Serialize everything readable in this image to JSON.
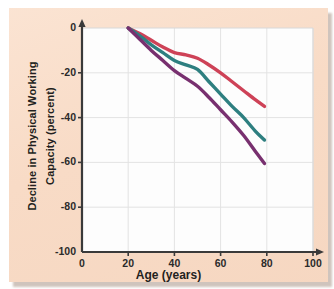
{
  "figure": {
    "background_color": "#f9ddc9",
    "plot_background_color": "#fdfdfd",
    "grid_color": "#e3e3e3",
    "axis_color": "#3a3a3a"
  },
  "chart_data": {
    "type": "line",
    "title": "",
    "subtitle": "",
    "xlabel": "Age (years)",
    "ylabel_line1": "Decline in Physical Working",
    "ylabel_line2": "Capacity (percent)",
    "xlim": [
      0,
      100
    ],
    "ylim": [
      -100,
      0
    ],
    "xticks": [
      0,
      20,
      40,
      60,
      80,
      100
    ],
    "yticks": [
      0,
      -20,
      -40,
      -60,
      -80,
      -100
    ],
    "xtick_labels": [
      "0",
      "20",
      "40",
      "60",
      "80",
      "100"
    ],
    "ytick_labels": [
      "0",
      "-20",
      "-40",
      "-60",
      "-80",
      "-100"
    ],
    "grid": true,
    "legend": false,
    "legend_position": "none",
    "annotations": [],
    "series": [
      {
        "name": "upper-curve",
        "color": "#ce4257",
        "line_width": 3.4,
        "x": [
          20,
          25,
          30,
          35,
          40,
          45,
          50,
          55,
          60,
          65,
          70,
          75,
          79
        ],
        "values": [
          0,
          -2.5,
          -5.5,
          -8.5,
          -11,
          -12,
          -13.5,
          -16.5,
          -20,
          -24,
          -28,
          -32,
          -35
        ]
      },
      {
        "name": "middle-curve",
        "color": "#2e7f80",
        "line_width": 3.4,
        "x": [
          20,
          25,
          30,
          35,
          40,
          45,
          50,
          55,
          60,
          65,
          70,
          75,
          79
        ],
        "values": [
          0,
          -3.5,
          -7.5,
          -11,
          -14.5,
          -16.5,
          -18.5,
          -24,
          -29.5,
          -35,
          -40,
          -46,
          -50
        ]
      },
      {
        "name": "lower-curve",
        "color": "#78306f",
        "line_width": 3.4,
        "x": [
          20,
          25,
          30,
          35,
          40,
          45,
          50,
          55,
          60,
          65,
          70,
          75,
          79
        ],
        "values": [
          0,
          -5,
          -10,
          -14.5,
          -19,
          -22.5,
          -26,
          -31,
          -36.5,
          -42,
          -48,
          -55,
          -60.5
        ]
      }
    ]
  }
}
